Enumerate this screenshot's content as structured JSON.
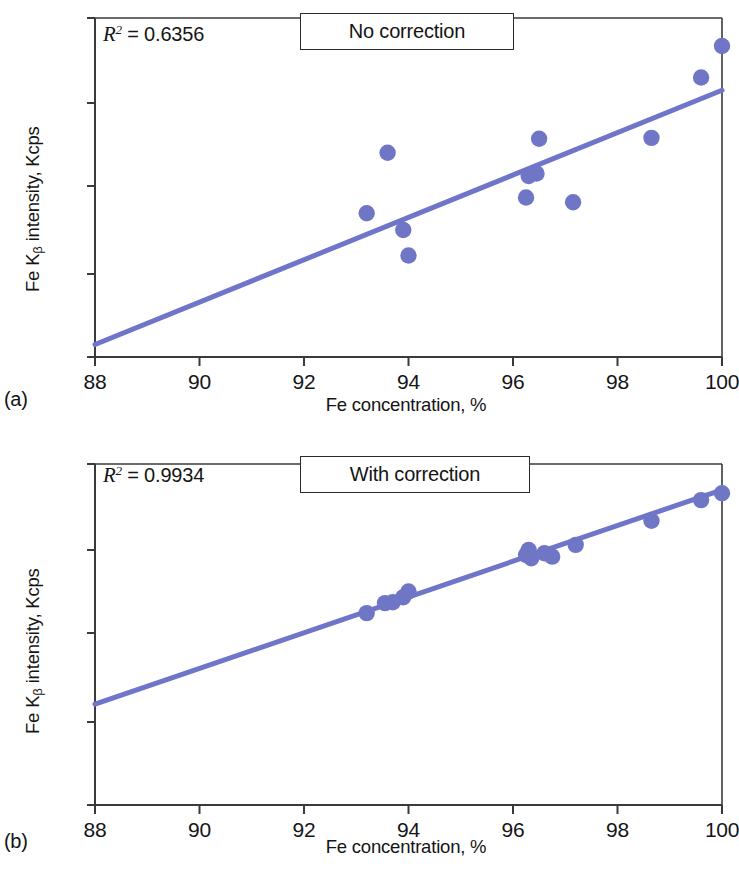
{
  "figure": {
    "marker_color": "#7076c6",
    "line_color": "#6f75c8",
    "axis_color": "#3a3a3a",
    "text_color": "#141414"
  },
  "panels": [
    {
      "letter": "(a)",
      "box_label": "No correction",
      "r2_prefix": "R",
      "r2_exp": "2",
      "r2_value": "= 0.6356",
      "xlabel": "Fe concentration, %",
      "ylabel_pre": "Fe K",
      "ylabel_sub": "β",
      "ylabel_post": " intensity, Kcps",
      "xticks": [
        "88",
        "90",
        "92",
        "94",
        "96",
        "98",
        "100"
      ],
      "yticks": [
        "420",
        "410",
        "400",
        "380",
        "360"
      ]
    },
    {
      "letter": "(b)",
      "box_label": "With correction",
      "r2_prefix": "R",
      "r2_exp": "2",
      "r2_value": "= 0.9934",
      "xlabel": "Fe concentration, %",
      "ylabel_pre": "Fe K",
      "ylabel_sub": "β",
      "ylabel_post": " intensity, Kcps",
      "xticks": [
        "88",
        "90",
        "92",
        "94",
        "96",
        "98",
        "100"
      ],
      "yticks": [
        "420",
        "410",
        "400",
        "380",
        "360"
      ]
    }
  ],
  "chart_data": [
    {
      "type": "scatter",
      "panel": "a",
      "title": "No correction",
      "xlabel": "Fe concentration, %",
      "ylabel": "Fe Kβ intensity, Kcps",
      "xlim": [
        88,
        100
      ],
      "ylim": [
        360,
        420
      ],
      "xticks": [
        88,
        90,
        92,
        94,
        96,
        98,
        100
      ],
      "yticks": [
        420,
        410,
        400,
        380,
        360
      ],
      "y_axis_note": "non-linear tick spacing: 360-380 segment compressed",
      "grid": false,
      "legend": false,
      "annotation": "R² = 0.6356",
      "r_squared": 0.6356,
      "points": [
        {
          "x": 93.2,
          "y": 393.8
        },
        {
          "x": 93.6,
          "y": 404.0
        },
        {
          "x": 93.9,
          "y": 390.0
        },
        {
          "x": 94.0,
          "y": 384.2
        },
        {
          "x": 96.25,
          "y": 397.4
        },
        {
          "x": 96.3,
          "y": 401.2
        },
        {
          "x": 96.45,
          "y": 401.5
        },
        {
          "x": 96.5,
          "y": 405.7
        },
        {
          "x": 97.15,
          "y": 396.3
        },
        {
          "x": 98.65,
          "y": 405.8
        },
        {
          "x": 99.6,
          "y": 413.0
        },
        {
          "x": 100.0,
          "y": 416.7
        }
      ],
      "trendline": {
        "x": [
          88,
          100
        ],
        "y": [
          363.0,
          411.5
        ]
      }
    },
    {
      "type": "scatter",
      "panel": "b",
      "title": "With correction",
      "xlabel": "Fe concentration, %",
      "ylabel": "Fe Kβ intensity, Kcps",
      "xlim": [
        88,
        100
      ],
      "ylim": [
        360,
        420
      ],
      "xticks": [
        88,
        90,
        92,
        94,
        96,
        98,
        100
      ],
      "yticks": [
        420,
        410,
        400,
        380,
        360
      ],
      "y_axis_note": "non-linear tick spacing: 360-380 segment compressed",
      "grid": false,
      "legend": false,
      "annotation": "R² = 0.9934",
      "r_squared": 0.9934,
      "points": [
        {
          "x": 93.2,
          "y": 402.4
        },
        {
          "x": 93.55,
          "y": 403.6
        },
        {
          "x": 93.7,
          "y": 403.7
        },
        {
          "x": 93.9,
          "y": 404.3
        },
        {
          "x": 94.0,
          "y": 405.0
        },
        {
          "x": 96.25,
          "y": 409.4
        },
        {
          "x": 96.3,
          "y": 410.0
        },
        {
          "x": 96.35,
          "y": 409.0
        },
        {
          "x": 96.6,
          "y": 409.6
        },
        {
          "x": 96.75,
          "y": 409.2
        },
        {
          "x": 97.2,
          "y": 410.6
        },
        {
          "x": 98.65,
          "y": 413.4
        },
        {
          "x": 99.6,
          "y": 415.8
        },
        {
          "x": 100.0,
          "y": 416.6
        }
      ],
      "trendline": {
        "x": [
          88,
          100
        ],
        "y": [
          384.0,
          417.0
        ]
      }
    }
  ]
}
